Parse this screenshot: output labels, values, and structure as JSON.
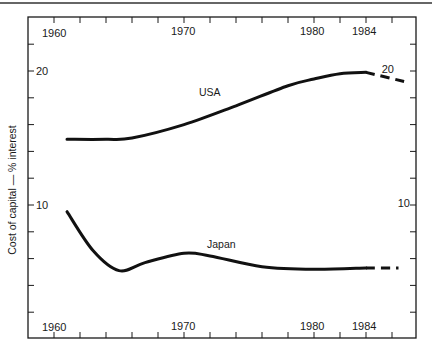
{
  "chart_data": {
    "type": "line",
    "title": "",
    "xlabel": "",
    "ylabel": "Cost of capital — % interest",
    "xlim": [
      1960,
      1988
    ],
    "ylim": [
      0,
      24
    ],
    "x_ticks_labeled": [
      "1960",
      "1970",
      "1980",
      "1984"
    ],
    "y_ticks_labeled": [
      "20",
      "10"
    ],
    "grid": false,
    "legend": "inline labels",
    "series": [
      {
        "name": "USA",
        "label_position": {
          "x": 1971.5,
          "y": 21.5
        },
        "solid": {
          "x": [
            1961,
            1964,
            1966,
            1970,
            1974,
            1978,
            1980,
            1982,
            1984
          ],
          "values": [
            14.9,
            14.9,
            15.0,
            16.0,
            17.4,
            18.9,
            19.4,
            19.8,
            19.9
          ]
        },
        "projected_dashed": {
          "x": [
            1984,
            1987
          ],
          "values": [
            19.9,
            19.2
          ]
        }
      },
      {
        "name": "Japan",
        "label_position": {
          "x": 1972,
          "y": 7.0
        },
        "solid": {
          "x": [
            1961,
            1963,
            1965,
            1967,
            1970,
            1972,
            1976,
            1980,
            1984
          ],
          "values": [
            9.5,
            6.6,
            5.1,
            5.7,
            6.4,
            6.2,
            5.4,
            5.2,
            5.3
          ]
        },
        "projected_dashed": {
          "x": [
            1984,
            1986.5
          ],
          "values": [
            5.3,
            5.3
          ]
        }
      }
    ]
  },
  "labels": {
    "top_x": [
      "1960",
      "1970",
      "1980",
      "1984"
    ],
    "bottom_x": [
      "1960",
      "1970",
      "1980",
      "1984"
    ],
    "left_y": [
      "20",
      "10"
    ],
    "right_y": [
      "20",
      "10"
    ],
    "usa": "USA",
    "japan": "Japan",
    "ylabel": "Cost of capital — % interest"
  }
}
